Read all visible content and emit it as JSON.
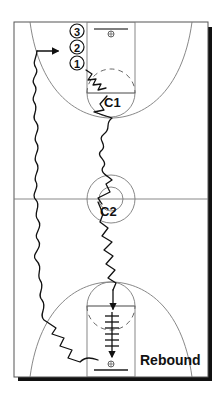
{
  "diagram": {
    "type": "basketball-court-drill",
    "colors": {
      "court_lines": "#7a7a7a",
      "paths": "#111111",
      "shadow": "#111111",
      "background": "#ffffff"
    },
    "players": [
      {
        "id": "p3",
        "label": "3"
      },
      {
        "id": "p2",
        "label": "2"
      },
      {
        "id": "p1",
        "label": "1"
      }
    ],
    "coaches": [
      {
        "id": "c1",
        "label": "C1"
      },
      {
        "id": "c2",
        "label": "C2"
      }
    ],
    "annotation": {
      "rebound_label": "Rebound"
    }
  }
}
